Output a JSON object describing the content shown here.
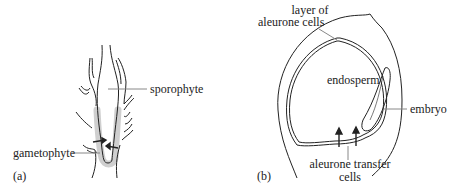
{
  "panel_a": {
    "caption": "(a)",
    "labels": {
      "sporophyte": "sporophyte",
      "gametophyte": "gametophyte"
    }
  },
  "panel_b": {
    "caption": "(b)",
    "labels": {
      "aleurone_layer_line1": "layer of",
      "aleurone_layer_line2": "aleurone cells",
      "endosperm": "endosperm",
      "embryo": "embryo",
      "transfer_line1": "aleurone transfer",
      "transfer_line2": "cells"
    }
  },
  "colors": {
    "line": "#222222",
    "shading": "#cfcfcf",
    "leader": "#888888"
  }
}
